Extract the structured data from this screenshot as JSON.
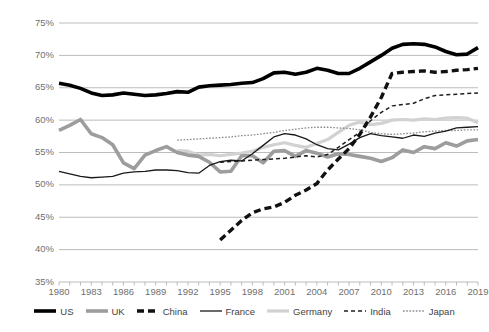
{
  "chart_data": {
    "type": "line",
    "title": "",
    "subtitle": "",
    "xlabel": "",
    "ylabel": "",
    "xlim": [
      1980,
      2019
    ],
    "ylim": [
      35,
      75
    ],
    "grid": true,
    "legend_position": "bottom",
    "y_ticks": [
      "35%",
      "40%",
      "45%",
      "50%",
      "55%",
      "60%",
      "65%",
      "70%",
      "75%"
    ],
    "y_tick_values": [
      35,
      40,
      45,
      50,
      55,
      60,
      65,
      70,
      75
    ],
    "x_ticks": [
      "1980",
      "1983",
      "1986",
      "1989",
      "1992",
      "1995",
      "1998",
      "2001",
      "2004",
      "2007",
      "2010",
      "2013",
      "2016",
      "2019"
    ],
    "x_tick_values": [
      1980,
      1983,
      1986,
      1989,
      1992,
      1995,
      1998,
      2001,
      2004,
      2007,
      2010,
      2013,
      2016,
      2019
    ],
    "x": [
      1980,
      1981,
      1982,
      1983,
      1984,
      1985,
      1986,
      1987,
      1988,
      1989,
      1990,
      1991,
      1992,
      1993,
      1994,
      1995,
      1996,
      1997,
      1998,
      1999,
      2000,
      2001,
      2002,
      2003,
      2004,
      2005,
      2006,
      2007,
      2008,
      2009,
      2010,
      2011,
      2012,
      2013,
      2014,
      2015,
      2016,
      2017,
      2018,
      2019
    ],
    "series": [
      {
        "name": "US",
        "color": "#000000",
        "style": "solid-thick",
        "values": [
          65.7,
          65.4,
          64.9,
          64.2,
          63.8,
          63.9,
          64.2,
          64.0,
          63.8,
          63.9,
          64.1,
          64.4,
          64.3,
          65.1,
          65.3,
          65.4,
          65.5,
          65.7,
          65.8,
          66.4,
          67.3,
          67.4,
          67.1,
          67.4,
          68.0,
          67.7,
          67.2,
          67.2,
          68.0,
          69.0,
          70.0,
          71.1,
          71.7,
          71.8,
          71.7,
          71.3,
          70.6,
          70.1,
          70.2,
          71.2
        ]
      },
      {
        "name": "UK",
        "color": "#9d9d9d",
        "style": "solid-thick",
        "values": [
          58.4,
          59.2,
          60.1,
          57.9,
          57.3,
          56.2,
          53.4,
          52.5,
          54.6,
          55.3,
          55.9,
          55.0,
          54.6,
          54.4,
          53.5,
          52.0,
          52.1,
          54.5,
          54.5,
          53.4,
          55.2,
          55.3,
          54.4,
          55.3,
          54.9,
          54.3,
          54.8,
          54.7,
          54.4,
          54.1,
          53.6,
          54.2,
          55.4,
          55.0,
          55.9,
          55.6,
          56.5,
          56.0,
          56.8,
          57.0
        ]
      },
      {
        "name": "China",
        "color": "#111111",
        "style": "dashed-thick",
        "values": [
          null,
          null,
          null,
          null,
          null,
          null,
          null,
          null,
          null,
          null,
          null,
          null,
          null,
          null,
          null,
          41.5,
          43.0,
          44.5,
          45.7,
          46.3,
          46.6,
          47.3,
          48.4,
          49.2,
          50.2,
          52.3,
          54.0,
          55.6,
          57.8,
          60.5,
          63.5,
          67.2,
          67.4,
          67.5,
          67.6,
          67.4,
          67.5,
          67.7,
          67.8,
          68.0
        ]
      },
      {
        "name": "France",
        "color": "#1a1a1a",
        "style": "solid-thin",
        "values": [
          52.1,
          51.7,
          51.3,
          51.1,
          51.2,
          51.3,
          51.8,
          52.0,
          52.1,
          52.3,
          52.3,
          52.2,
          51.9,
          51.8,
          53.0,
          53.6,
          53.8,
          53.7,
          54.8,
          56.1,
          57.4,
          57.9,
          57.7,
          57.1,
          56.2,
          55.6,
          55.4,
          56.3,
          57.3,
          57.9,
          57.6,
          57.4,
          57.2,
          57.7,
          57.5,
          58.0,
          58.3,
          58.8,
          58.9,
          59.0
        ]
      },
      {
        "name": "Germany",
        "color": "#d2d2d2",
        "style": "solid-thick-light",
        "values": [
          null,
          null,
          null,
          null,
          null,
          null,
          null,
          null,
          null,
          null,
          null,
          55.3,
          55.2,
          54.6,
          54.7,
          54.5,
          54.7,
          54.9,
          55.2,
          55.8,
          56.2,
          56.5,
          56.1,
          55.8,
          56.4,
          57.0,
          58.1,
          59.2,
          59.7,
          59.3,
          59.5,
          60.0,
          60.1,
          60.0,
          60.2,
          60.1,
          60.3,
          60.4,
          60.3,
          59.6
        ]
      },
      {
        "name": "India",
        "color": "#1f1f1f",
        "style": "dashed-thin",
        "values": [
          null,
          null,
          null,
          null,
          null,
          null,
          null,
          null,
          null,
          null,
          null,
          null,
          null,
          null,
          null,
          53.5,
          53.6,
          53.7,
          53.8,
          53.9,
          54.0,
          54.1,
          54.3,
          54.5,
          54.3,
          54.7,
          55.8,
          57.0,
          58.1,
          59.9,
          61.2,
          62.2,
          62.4,
          62.6,
          63.3,
          63.8,
          63.9,
          64.0,
          64.1,
          64.2
        ]
      },
      {
        "name": "Japan",
        "color": "#8a8a8a",
        "style": "dotted",
        "values": [
          null,
          null,
          null,
          null,
          null,
          null,
          null,
          null,
          null,
          null,
          null,
          56.9,
          57.0,
          57.1,
          57.2,
          57.3,
          57.4,
          57.6,
          57.7,
          57.9,
          58.1,
          58.4,
          58.6,
          58.8,
          58.9,
          58.9,
          58.8,
          58.7,
          58.5,
          58.1,
          57.9,
          57.8,
          57.9,
          58.0,
          58.2,
          58.3,
          58.4,
          58.4,
          58.5,
          58.5
        ]
      }
    ]
  },
  "legend": {
    "items": [
      {
        "label": "US",
        "icon": "line-swatch-solid-thick-black"
      },
      {
        "label": "UK",
        "icon": "line-swatch-solid-thick-gray"
      },
      {
        "label": "China",
        "icon": "line-swatch-dashed-thick-black"
      },
      {
        "label": "France",
        "icon": "line-swatch-solid-thin-black"
      },
      {
        "label": "Germany",
        "icon": "line-swatch-solid-thick-lightgray"
      },
      {
        "label": "India",
        "icon": "line-swatch-dashed-thin-black"
      },
      {
        "label": "Japan",
        "icon": "line-swatch-dotted-gray"
      }
    ]
  }
}
